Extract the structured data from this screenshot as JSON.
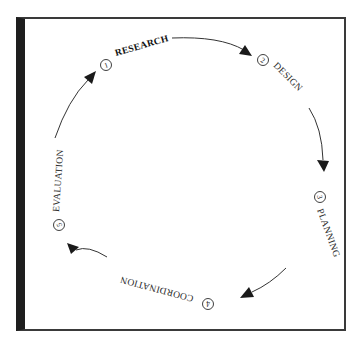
{
  "diagram": {
    "type": "cycle",
    "colors": {
      "frame_border": "#3a3a3a",
      "left_bar": "#1e1e1e",
      "text": "#2a2a2a",
      "arrow": "#333333",
      "background": "#ffffff"
    },
    "stages": [
      {
        "number": "1",
        "label": "RESEARCH",
        "emphasized": true
      },
      {
        "number": "2",
        "label": "DESIGN",
        "emphasized": false
      },
      {
        "number": "3",
        "label": "PLANNING",
        "emphasized": false
      },
      {
        "number": "4",
        "label": "COORDINATION",
        "emphasized": false
      },
      {
        "number": "5",
        "label": "EVALUATION",
        "emphasized": false
      }
    ],
    "edges": [
      {
        "from": "RESEARCH",
        "to": "DESIGN"
      },
      {
        "from": "DESIGN",
        "to": "PLANNING"
      },
      {
        "from": "PLANNING",
        "to": "COORDINATION"
      },
      {
        "from": "COORDINATION",
        "to": "EVALUATION"
      },
      {
        "from": "EVALUATION",
        "to": "RESEARCH"
      }
    ]
  }
}
